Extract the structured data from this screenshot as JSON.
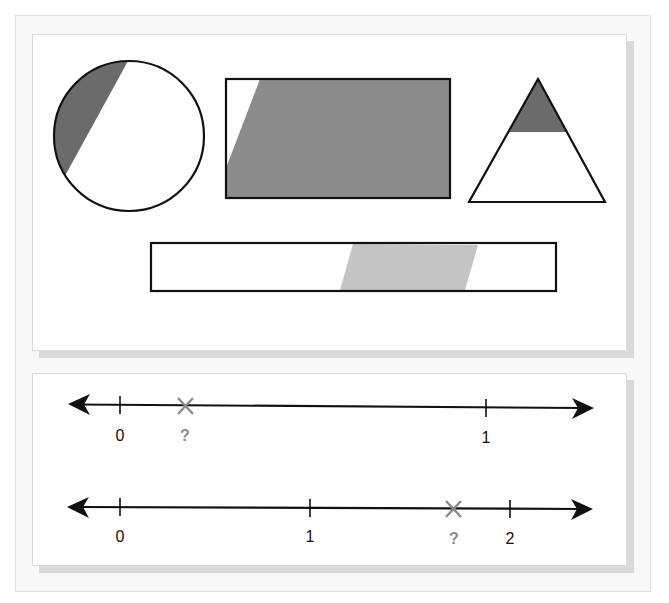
{
  "colors": {
    "outline": "#111111",
    "shade_dark": "#6b6b6b",
    "shade_medium": "#8c8c8c",
    "shade_light": "#c4c4c4",
    "marker": "#8a8a8a",
    "panel_bg": "#ffffff",
    "frame_bg": "#f8f8f8"
  },
  "shapes_panel": {
    "shapes": [
      {
        "type": "circle",
        "description": "circle with dark shaded segment on upper-left"
      },
      {
        "type": "rectangle",
        "description": "rectangle mostly shaded medium gray with small white wedge at top-left"
      },
      {
        "type": "triangle",
        "description": "triangle with dark shaded top portion"
      },
      {
        "type": "bar",
        "description": "long rectangle with light gray slanted band in right-center"
      }
    ]
  },
  "number_lines": [
    {
      "id": "line-1",
      "ticks": [
        {
          "label": "0",
          "value": 0
        },
        {
          "label": "1",
          "value": 1
        }
      ],
      "marker": {
        "symbol": "×",
        "label": "?",
        "approx_value": 0.18
      }
    },
    {
      "id": "line-2",
      "ticks": [
        {
          "label": "0",
          "value": 0
        },
        {
          "label": "1",
          "value": 1
        },
        {
          "label": "2",
          "value": 2
        }
      ],
      "marker": {
        "symbol": "×",
        "label": "?",
        "approx_value": 1.75
      }
    }
  ]
}
